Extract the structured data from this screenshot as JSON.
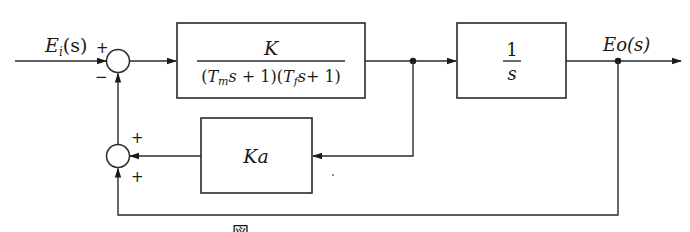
{
  "diagram": {
    "type": "control-system-block-diagram",
    "input": {
      "label_main": "E",
      "label_sub": "i",
      "label_arg": "(s)"
    },
    "output": {
      "label": "Eo(s)"
    },
    "sum_junction_1": {
      "sign_top": "+",
      "sign_bottom": "−"
    },
    "sum_junction_2": {
      "sign_top": "+",
      "sign_bottom": "+"
    },
    "blocks": [
      {
        "id": "forward-plant",
        "numerator": "K",
        "denominator_parts": [
          "(T",
          "m",
          "s + 1)(T",
          "f",
          "s+ 1)"
        ]
      },
      {
        "id": "integrator",
        "numerator": "1",
        "denominator": "s"
      },
      {
        "id": "feedback-gain",
        "label": "Ka"
      }
    ],
    "caption": "図 ── ── ── ── ── ── ─ ── ── ── ── ──"
  }
}
